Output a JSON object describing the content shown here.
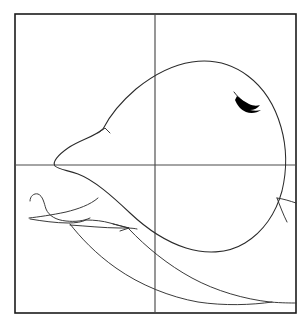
{
  "image": {
    "kind": "line-drawing",
    "subject": "whale",
    "title": "Whale line drawing with quadrant guide lines",
    "background_color": "#ffffff",
    "ink_color": "#2a2a2a",
    "frame_color": "#1b1b1b",
    "guide_color": "#4a4a4a",
    "accent_color": "#000000",
    "width": 307,
    "height": 325
  },
  "frame": {
    "name": "border-rectangle",
    "x": 15,
    "y": 14,
    "width": 281,
    "height": 299,
    "stroke_width": 1.6
  },
  "guides": {
    "vertical": {
      "label": "vertical-center-guide",
      "x": 155,
      "y1": 14,
      "y2": 313
    },
    "horizontal": {
      "label": "horizontal-center-guide",
      "x1": 15,
      "x2": 296,
      "y": 165
    },
    "crosshair_center": {
      "x": 155,
      "y": 165
    }
  },
  "shapes": {
    "body": {
      "name": "whale-body-outline",
      "description": "large rounded teardrop body, widest right, tapering to a snout at left",
      "d": "M 103 129 C 110 115 122 101 136 89 C 152 76 172 65 192 62 C 212 59 232 64 248 76 C 264 88 275 106 281 127 C 287 148 287 170 282 191 C 276 213 263 232 245 243 C 227 254 205 254 186 248 C 167 242 148 230 130 213 C 112 196 94 180 78 174 C 66 170 58 169 55 166 C 52 162 58 155 68 148 C 80 140 94 137 103 129 Z"
    },
    "snout_notch": {
      "name": "snout-notch-detail",
      "description": "small kink in outline near upper-left of body",
      "d": "M 98 133 L 105 128 L 110 133"
    },
    "flipper_upper": {
      "name": "flipper-upper-edge",
      "description": "hooked flipper shape at lower left",
      "d": "M 30 201 C 30 196 34 193 38 194 C 43 196 44 203 46 209 C 49 216 56 220 66 221 C 75 222 84 221 90 218"
    },
    "flipper_lower": {
      "name": "flipper-lower-edge",
      "description": "underside of the flipper running to the tip",
      "d": "M 29 218 C 38 217 52 215 66 212 C 78 209 90 205 98 198"
    },
    "flipper_inner": {
      "name": "flipper-inner-crease",
      "description": "inner crease line of the flipper",
      "d": "M 30 219 C 42 221 56 223 68 223 C 76 223 82 222 86 220"
    },
    "flipper_join": {
      "name": "flipper-body-join",
      "description": "line joining flipper to the body underside",
      "d": "M 86 220 C 95 220 103 221 110 223 C 118 225 124 227 129 228"
    },
    "belly_line": {
      "name": "belly-contour",
      "description": "long belly line sweeping right under the body",
      "d": "M 70 225 C 86 226 104 228 120 228 C 128 228 133 228 137 229"
    },
    "belly_arrow": {
      "name": "belly-arrow-notch",
      "description": "small arrow-shaped notch where belly meets lower outline",
      "d": "M 113 224 L 129 228 L 120 231"
    },
    "throat_groove": {
      "name": "throat-groove",
      "description": "long sweeping throat groove toward the tail at bottom",
      "d": "M 70 224 C 80 237 96 254 116 268 C 140 285 170 297 198 302 C 224 306 252 305 272 302"
    },
    "lower_sweep": {
      "name": "lower-body-sweep",
      "description": "second long curve below the belly heading to lower right",
      "d": "M 129 229 C 146 247 168 265 192 278 C 216 291 244 299 270 302 C 282 303 291 303 296 303"
    },
    "tail_edge": {
      "name": "tail-edge-line",
      "description": "line running off the right frame edge from the body flank",
      "d": "M 277 198 C 284 199 290 201 296 203"
    },
    "tail_fork": {
      "name": "tail-fork-line",
      "description": "short branch off the flank toward the lower right",
      "d": "M 277 198 C 280 206 283 214 287 222"
    }
  },
  "eye": {
    "name": "eye-mark",
    "description": "solid black pointed blot with thin hairline flick extending up-left",
    "blot_d": "M 237 96 C 241 99 245 102 249 104 C 253 106 257 106 260 105 C 258 108 254 110 250 110 C 254 111 258 111 261 110 C 257 113 251 114 246 112 C 241 110 237 105 235 100 Z",
    "whisker_d": "M 234 92 C 237 96 241 100 246 104",
    "color": "#000000",
    "position": {
      "x": 248,
      "y": 103
    }
  }
}
